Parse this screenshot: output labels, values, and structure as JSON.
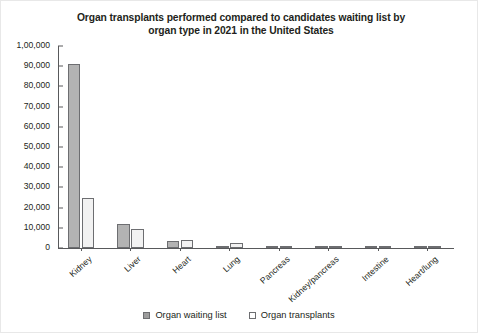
{
  "chart_data": {
    "type": "bar",
    "title": "Organ transplants performed compared to candidates waiting list by organ type in 2021 in the United States",
    "title_line1": "Organ transplants performed compared to candidates waiting list by",
    "title_line2": "organ type in 2021 in the United States",
    "xlabel": "",
    "ylabel": "",
    "ylim": [
      0,
      100000
    ],
    "ytick_values": [
      0,
      10000,
      20000,
      30000,
      40000,
      50000,
      60000,
      70000,
      80000,
      90000,
      100000
    ],
    "ytick_labels": [
      "0",
      "10,000",
      "20,000",
      "30,000",
      "40,000",
      "50,000",
      "60,000",
      "70,000",
      "80,000",
      "90,000",
      "1,00,000"
    ],
    "grid": false,
    "legend_position": "bottom",
    "categories": [
      "Kidney",
      "Liver",
      "Heart",
      "Lung",
      "Pancreas",
      "Kidney/pancreas",
      "Intestine",
      "Heart/lung"
    ],
    "series": [
      {
        "name": "Organ waiting list",
        "color": "#b3b3b3",
        "values": [
          91000,
          12000,
          3500,
          1000,
          900,
          850,
          200,
          40
        ]
      },
      {
        "name": "Organ transplants",
        "color": "#f2f2f2",
        "values": [
          25000,
          9200,
          3800,
          2500,
          400,
          800,
          100,
          40
        ]
      }
    ]
  },
  "legend": {
    "items": [
      {
        "label": "Organ waiting list",
        "swatch": "waiting"
      },
      {
        "label": "Organ transplants",
        "swatch": "transplant"
      }
    ]
  }
}
